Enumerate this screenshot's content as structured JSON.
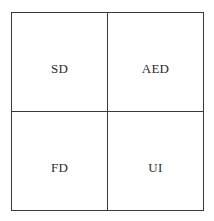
{
  "figure": {
    "name": "two-by-two-quadrant-grid",
    "rows": 2,
    "columns": 2,
    "border_color": "#3a3a3a",
    "background_color": "#ffffff",
    "text_color": "#2b2b2b",
    "cells": [
      {
        "position": "top-left",
        "label": "SD"
      },
      {
        "position": "top-right",
        "label": "AED"
      },
      {
        "position": "bottom-left",
        "label": "FD"
      },
      {
        "position": "bottom-right",
        "label": "UI"
      }
    ]
  }
}
